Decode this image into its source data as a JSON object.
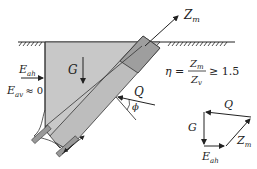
{
  "diagram": {
    "labels": {
      "anchor_force": "Z",
      "anchor_force_sub": "m",
      "weight": "G",
      "earth_pressure_h": "E",
      "earth_pressure_h_sub": "ah",
      "earth_pressure_v": "E",
      "earth_pressure_v_sub": "av",
      "earth_pressure_v_value": "≈ 0",
      "reaction": "Q",
      "friction_angle": "ϕ"
    },
    "safety_formula": {
      "lhs": "η =",
      "numerator": "Z",
      "numerator_sub": "m",
      "denominator": "Z",
      "denominator_sub": "v",
      "relation": "≥ 1.5"
    },
    "force_polygon": {
      "top": "Q",
      "left": "G",
      "bottom": "E",
      "bottom_sub": "ah",
      "diagonal": "Z",
      "diagonal_sub": "m"
    },
    "colors": {
      "soil_block": "#c8c8c8",
      "anchor_body": "#a9a9a9",
      "stroke": "#222222"
    }
  }
}
